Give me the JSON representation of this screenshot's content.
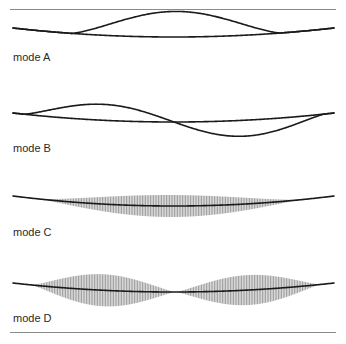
{
  "figure": {
    "rules": {
      "top_y": 9,
      "bottom_y": 332,
      "color": "#8a8a8a"
    },
    "stroke_color": "#1a1a1a",
    "hatch_color": "#6e6e6e",
    "string": {
      "x_start": 13,
      "x_end": 334
    },
    "modes": [
      {
        "id": "A",
        "label": "mode A",
        "label_y": 51,
        "style": "outline",
        "end_y": 28,
        "sag": 9,
        "description": "single antinode: upper envelope bulges above string between two side nodes",
        "envelope": {
          "x0": 72,
          "x1": 280,
          "amplitude": -17
        }
      },
      {
        "id": "B",
        "label": "mode B",
        "label_y": 142,
        "style": "outline",
        "end_y": 113,
        "sag": 9,
        "description": "two antinodes of opposite sign with a central node",
        "envelope": {
          "x0": 24,
          "x1": 324,
          "amplitude": 17
        }
      },
      {
        "id": "C",
        "label": "mode C",
        "label_y": 226,
        "style": "hatched",
        "end_y": 196,
        "sag": 10,
        "description": "single hatched lens centred on string",
        "lobes": [
          {
            "x0": 40,
            "x1": 300,
            "half_height": 11
          }
        ]
      },
      {
        "id": "D",
        "label": "mode D",
        "label_y": 312,
        "style": "hatched",
        "end_y": 283,
        "sag": 9,
        "description": "two hatched lenses meeting at a central node",
        "lobes": [
          {
            "x0": 32,
            "x1": 175,
            "half_height": 16
          },
          {
            "x0": 176,
            "x1": 320,
            "half_height": 15
          }
        ]
      }
    ]
  }
}
